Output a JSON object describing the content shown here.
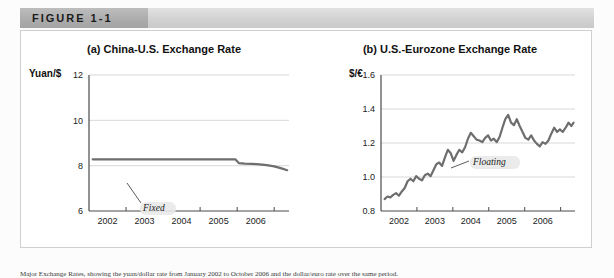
{
  "figure": {
    "tab_label": "FIGURE 1-1",
    "caption": "Major Exchange Rates, showing the yuan/dollar rate from January 2002 to October 2006 and the dollar/euro rate over the same period."
  },
  "chart_data": [
    {
      "type": "line",
      "panel": "(a)",
      "title": "(a) China-U.S. Exchange Rate",
      "ylabel": "Yuan/$",
      "xlabel": "",
      "ylim": [
        6,
        12
      ],
      "yticks": [
        6,
        8,
        10,
        12
      ],
      "ytick_labels": [
        "6",
        "8",
        "10",
        "12"
      ],
      "xlim": [
        2001.5,
        2006.9
      ],
      "xticks": [
        2002,
        2003,
        2004,
        2005,
        2006
      ],
      "xtick_labels": [
        "2002",
        "2003",
        "2004",
        "2005",
        "2006"
      ],
      "grid": true,
      "legend": "none",
      "annotation": "Fixed",
      "series": [
        {
          "name": "Yuan per U.S. dollar",
          "color": "#6e6e6e",
          "x": [
            2001.6,
            2002.0,
            2002.5,
            2003.0,
            2003.5,
            2004.0,
            2004.5,
            2005.0,
            2005.45,
            2005.55,
            2005.7,
            2005.9,
            2006.1,
            2006.3,
            2006.5,
            2006.7,
            2006.85
          ],
          "values": [
            8.28,
            8.28,
            8.28,
            8.28,
            8.28,
            8.28,
            8.28,
            8.28,
            8.28,
            8.11,
            8.09,
            8.08,
            8.06,
            8.02,
            7.97,
            7.88,
            7.8
          ]
        }
      ]
    },
    {
      "type": "line",
      "panel": "(b)",
      "title": "(b) U.S.-Eurozone Exchange Rate",
      "ylabel": "$/€",
      "xlabel": "",
      "ylim": [
        0.8,
        1.6
      ],
      "yticks": [
        0.8,
        1.0,
        1.2,
        1.4,
        1.6
      ],
      "ytick_labels": [
        "0.8",
        "1.0",
        "1.2",
        "1.4",
        "1.6"
      ],
      "xlim": [
        2001.5,
        2006.9
      ],
      "xticks": [
        2002,
        2003,
        2004,
        2005,
        2006
      ],
      "xtick_labels": [
        "2002",
        "2003",
        "2004",
        "2005",
        "2006"
      ],
      "grid": true,
      "legend": "none",
      "annotation": "Floating",
      "series": [
        {
          "name": "U.S. dollars per euro",
          "color": "#6e6e6e",
          "x": [
            2001.6,
            2001.68,
            2001.76,
            2001.84,
            2001.92,
            2002.0,
            2002.08,
            2002.16,
            2002.24,
            2002.32,
            2002.4,
            2002.48,
            2002.56,
            2002.64,
            2002.72,
            2002.8,
            2002.88,
            2002.96,
            2003.04,
            2003.12,
            2003.2,
            2003.28,
            2003.36,
            2003.44,
            2003.52,
            2003.6,
            2003.68,
            2003.76,
            2003.84,
            2003.92,
            2004.0,
            2004.08,
            2004.16,
            2004.24,
            2004.32,
            2004.4,
            2004.48,
            2004.56,
            2004.64,
            2004.72,
            2004.8,
            2004.88,
            2004.96,
            2005.04,
            2005.12,
            2005.2,
            2005.28,
            2005.36,
            2005.44,
            2005.52,
            2005.6,
            2005.68,
            2005.76,
            2005.84,
            2005.92,
            2006.0,
            2006.08,
            2006.16,
            2006.24,
            2006.32,
            2006.4,
            2006.48,
            2006.56,
            2006.64,
            2006.72,
            2006.8,
            2006.86
          ],
          "values": [
            0.87,
            0.885,
            0.88,
            0.895,
            0.905,
            0.89,
            0.915,
            0.935,
            0.975,
            0.99,
            0.975,
            1.005,
            0.99,
            0.98,
            1.01,
            1.02,
            1.005,
            1.04,
            1.075,
            1.085,
            1.065,
            1.115,
            1.16,
            1.14,
            1.095,
            1.13,
            1.16,
            1.145,
            1.175,
            1.225,
            1.26,
            1.24,
            1.22,
            1.215,
            1.205,
            1.23,
            1.245,
            1.215,
            1.225,
            1.205,
            1.235,
            1.29,
            1.34,
            1.365,
            1.32,
            1.305,
            1.34,
            1.3,
            1.265,
            1.23,
            1.22,
            1.245,
            1.215,
            1.195,
            1.18,
            1.205,
            1.195,
            1.215,
            1.255,
            1.29,
            1.265,
            1.28,
            1.265,
            1.29,
            1.32,
            1.3,
            1.32
          ]
        }
      ]
    }
  ]
}
